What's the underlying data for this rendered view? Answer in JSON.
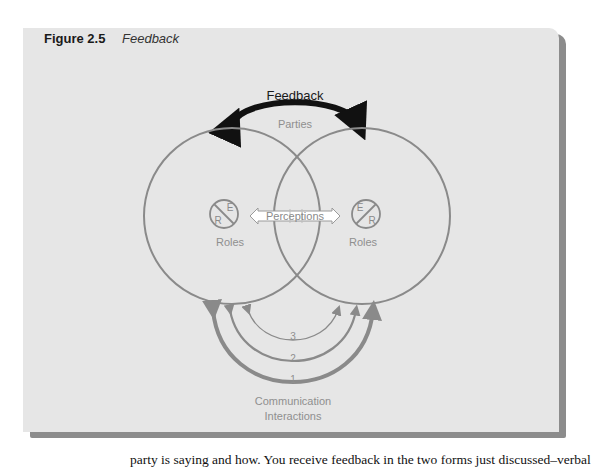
{
  "figure": {
    "number": "Figure 2.5",
    "title": "Feedback"
  },
  "diagram": {
    "feedback_label": "Feedback",
    "parties_label": "Parties",
    "perceptions_label": "Perceptions",
    "left_role": {
      "label": "Roles",
      "letters": [
        "E",
        "R"
      ]
    },
    "right_role": {
      "label": "Roles",
      "letters": [
        "E",
        "R"
      ]
    },
    "interaction_arcs": [
      "1",
      "2",
      "3"
    ],
    "communication_label_line1": "Communication",
    "communication_label_line2": "Interactions",
    "colors": {
      "panel": "#e6e6e6",
      "shadow": "#8c8c8c",
      "circle_stroke": "#8a8a8a",
      "feedback_arrow": "#111111",
      "label_gray": "#8f8f8f"
    }
  },
  "body_text": "party is saying and how. You receive feedback in the two forms just discussed–verbal"
}
